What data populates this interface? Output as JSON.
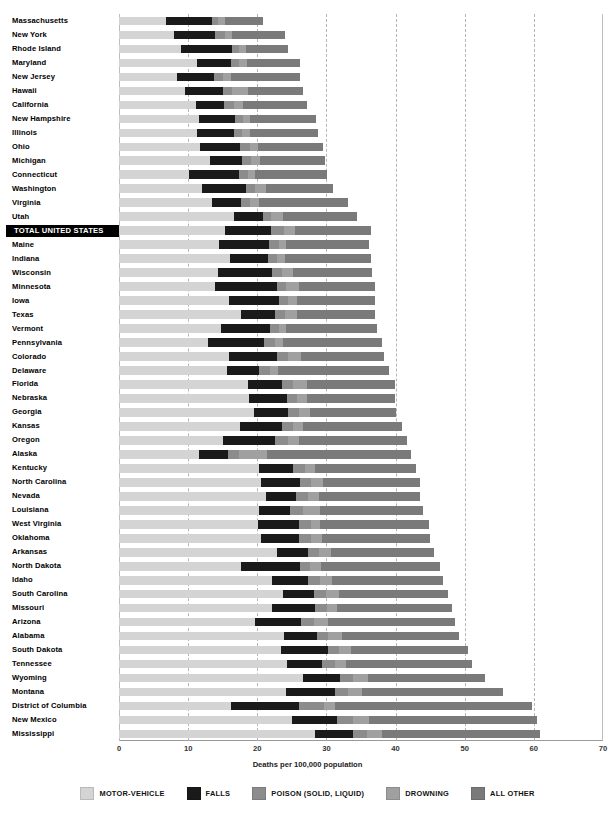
{
  "chart_data": {
    "type": "bar",
    "orientation": "horizontal",
    "stacked": true,
    "title": "",
    "xlabel": "Deaths per 100,000 population",
    "ylabel": "",
    "xlim": [
      0,
      70
    ],
    "xticks": [
      0,
      10,
      20,
      30,
      40,
      50,
      60,
      70
    ],
    "grid": "vertical dashed at 10,20,30,40,50,60",
    "legend_position": "bottom",
    "series": [
      {
        "name": "MOTOR-VEHICLE",
        "color": "#d4d4d4"
      },
      {
        "name": "FALLS",
        "color": "#1a1a1a"
      },
      {
        "name": "POISON (SOLID, LIQUID)",
        "color": "#8c8c8c"
      },
      {
        "name": "DROWNING",
        "color": "#a0a0a0"
      },
      {
        "name": "ALL OTHER",
        "color": "#7a7a7a"
      }
    ],
    "categories": [
      "Massachusetts",
      "New York",
      "Rhode Island",
      "Maryland",
      "New Jersey",
      "Hawaii",
      "California",
      "New Hampshire",
      "Illinois",
      "Ohio",
      "Michigan",
      "Connecticut",
      "Washington",
      "Virginia",
      "Utah",
      "TOTAL UNITED STATES",
      "Maine",
      "Indiana",
      "Wisconsin",
      "Minnesota",
      "Iowa",
      "Texas",
      "Vermont",
      "Pennsylvania",
      "Colorado",
      "Delaware",
      "Florida",
      "Nebraska",
      "Georgia",
      "Kansas",
      "Oregon",
      "Alaska",
      "Kentucky",
      "North Carolina",
      "Nevada",
      "Louisiana",
      "West Virginia",
      "Oklahoma",
      "Arkansas",
      "North Dakota",
      "Idaho",
      "South Carolina",
      "Missouri",
      "Arizona",
      "Alabama",
      "South Dakota",
      "Tennessee",
      "Wyoming",
      "Montana",
      "District of Columbia",
      "New Mexico",
      "Mississippi"
    ],
    "rows": [
      {
        "state": "Massachusetts",
        "total": 20.9,
        "values": [
          6.8,
          6.6,
          0.9,
          1.0,
          5.6
        ],
        "highlight": false
      },
      {
        "state": "New York",
        "total": 24.0,
        "values": [
          7.9,
          6.0,
          1.4,
          1.1,
          7.6
        ],
        "highlight": false
      },
      {
        "state": "Rhode Island",
        "total": 24.5,
        "values": [
          9.0,
          7.3,
          1.0,
          1.0,
          6.2
        ],
        "highlight": false
      },
      {
        "state": "Maryland",
        "total": 26.2,
        "values": [
          11.3,
          4.9,
          1.1,
          1.2,
          7.7
        ],
        "highlight": false
      },
      {
        "state": "New Jersey",
        "total": 26.2,
        "values": [
          8.4,
          5.3,
          1.3,
          1.2,
          10.0
        ],
        "highlight": false
      },
      {
        "state": "Hawaii",
        "total": 26.6,
        "values": [
          9.6,
          5.4,
          1.3,
          2.4,
          7.9
        ],
        "highlight": false
      },
      {
        "state": "California",
        "total": 27.2,
        "values": [
          11.1,
          4.1,
          1.4,
          1.4,
          9.2
        ],
        "highlight": false
      },
      {
        "state": "New Hampshire",
        "total": 28.5,
        "values": [
          11.6,
          5.2,
          1.2,
          1.0,
          9.5
        ],
        "highlight": false
      },
      {
        "state": "Illinois",
        "total": 28.8,
        "values": [
          11.3,
          5.3,
          1.2,
          1.2,
          9.8
        ],
        "highlight": false
      },
      {
        "state": "Ohio",
        "total": 29.5,
        "values": [
          11.7,
          5.8,
          1.5,
          1.1,
          9.4
        ],
        "highlight": false
      },
      {
        "state": "Michigan",
        "total": 29.8,
        "values": [
          13.1,
          4.7,
          1.3,
          1.3,
          9.4
        ],
        "highlight": false
      },
      {
        "state": "Connecticut",
        "total": 30.1,
        "values": [
          10.1,
          7.2,
          1.3,
          1.0,
          10.5
        ],
        "highlight": false
      },
      {
        "state": "Washington",
        "total": 31.0,
        "values": [
          12.0,
          6.4,
          1.3,
          1.5,
          9.8
        ],
        "highlight": false
      },
      {
        "state": "Virginia",
        "total": 33.1,
        "values": [
          13.5,
          4.1,
          1.4,
          1.3,
          12.8
        ],
        "highlight": false
      },
      {
        "state": "Utah",
        "total": 34.4,
        "values": [
          16.6,
          4.3,
          1.1,
          1.7,
          10.7
        ],
        "highlight": false
      },
      {
        "state": "TOTAL UNITED STATES",
        "total": 36.5,
        "values": [
          15.4,
          6.6,
          1.9,
          1.5,
          11.1
        ],
        "highlight": true
      },
      {
        "state": "Maine",
        "total": 36.2,
        "values": [
          14.5,
          7.2,
          1.4,
          1.1,
          12.0
        ],
        "highlight": false
      },
      {
        "state": "Indiana",
        "total": 36.5,
        "values": [
          16.1,
          5.4,
          1.4,
          1.1,
          12.5
        ],
        "highlight": false
      },
      {
        "state": "Wisconsin",
        "total": 36.6,
        "values": [
          14.3,
          7.9,
          1.4,
          1.5,
          11.5
        ],
        "highlight": false
      },
      {
        "state": "Minnesota",
        "total": 37.0,
        "values": [
          13.9,
          9.0,
          1.3,
          1.8,
          11.0
        ],
        "highlight": false
      },
      {
        "state": "Iowa",
        "total": 37.0,
        "values": [
          15.9,
          7.3,
          1.2,
          1.4,
          11.2
        ],
        "highlight": false
      },
      {
        "state": "Texas",
        "total": 37.1,
        "values": [
          17.7,
          4.8,
          1.5,
          1.8,
          11.3
        ],
        "highlight": false
      },
      {
        "state": "Vermont",
        "total": 37.3,
        "values": [
          14.8,
          7.0,
          1.3,
          1.1,
          13.1
        ],
        "highlight": false
      },
      {
        "state": "Pennsylvania",
        "total": 38.1,
        "values": [
          12.8,
          8.2,
          1.6,
          1.1,
          14.4
        ],
        "highlight": false
      },
      {
        "state": "Colorado",
        "total": 38.4,
        "values": [
          15.9,
          6.9,
          1.6,
          1.9,
          12.1
        ],
        "highlight": false
      },
      {
        "state": "Delaware",
        "total": 39.0,
        "values": [
          15.6,
          4.7,
          1.5,
          1.2,
          16.0
        ],
        "highlight": false
      },
      {
        "state": "Florida",
        "total": 39.9,
        "values": [
          18.6,
          5.0,
          1.6,
          2.0,
          12.7
        ],
        "highlight": false
      },
      {
        "state": "Nebraska",
        "total": 39.9,
        "values": [
          18.8,
          5.5,
          1.5,
          1.4,
          12.7
        ],
        "highlight": false
      },
      {
        "state": "Georgia",
        "total": 40.0,
        "values": [
          19.5,
          5.0,
          1.5,
          1.6,
          12.4
        ],
        "highlight": false
      },
      {
        "state": "Kansas",
        "total": 41.0,
        "values": [
          17.5,
          6.1,
          1.5,
          1.5,
          14.4
        ],
        "highlight": false
      },
      {
        "state": "Oregon",
        "total": 41.6,
        "values": [
          15.0,
          7.6,
          1.8,
          1.6,
          15.6
        ],
        "highlight": false
      },
      {
        "state": "Alaska",
        "total": 42.3,
        "values": [
          11.6,
          4.1,
          1.7,
          4.0,
          20.9
        ],
        "highlight": false
      },
      {
        "state": "Kentucky",
        "total": 43.0,
        "values": [
          20.2,
          5.0,
          1.7,
          1.5,
          14.6
        ],
        "highlight": false
      },
      {
        "state": "North Carolina",
        "total": 43.5,
        "values": [
          20.6,
          5.6,
          1.6,
          1.7,
          14.0
        ],
        "highlight": false
      },
      {
        "state": "Nevada",
        "total": 43.6,
        "values": [
          21.3,
          4.3,
          1.7,
          1.6,
          14.7
        ],
        "highlight": false
      },
      {
        "state": "Louisiana",
        "total": 44.0,
        "values": [
          20.3,
          4.5,
          1.8,
          2.5,
          14.9
        ],
        "highlight": false
      },
      {
        "state": "West Virginia",
        "total": 44.8,
        "values": [
          20.1,
          6.0,
          1.7,
          1.3,
          15.7
        ],
        "highlight": false
      },
      {
        "state": "Oklahoma",
        "total": 45.0,
        "values": [
          20.6,
          5.5,
          1.6,
          1.6,
          15.7
        ],
        "highlight": false
      },
      {
        "state": "Arkansas",
        "total": 45.5,
        "values": [
          22.8,
          4.5,
          1.6,
          1.7,
          14.9
        ],
        "highlight": false
      },
      {
        "state": "North Dakota",
        "total": 46.5,
        "values": [
          17.7,
          8.5,
          1.4,
          1.6,
          17.3
        ],
        "highlight": false
      },
      {
        "state": "Idaho",
        "total": 46.9,
        "values": [
          22.2,
          5.2,
          1.6,
          1.8,
          16.1
        ],
        "highlight": false
      },
      {
        "state": "South Carolina",
        "total": 47.6,
        "values": [
          23.7,
          4.5,
          1.7,
          1.9,
          15.8
        ],
        "highlight": false
      },
      {
        "state": "Missouri",
        "total": 48.2,
        "values": [
          22.1,
          6.2,
          1.8,
          1.5,
          16.6
        ],
        "highlight": false
      },
      {
        "state": "Arizona",
        "total": 48.6,
        "values": [
          19.7,
          6.6,
          1.9,
          2.1,
          18.3
        ],
        "highlight": false
      },
      {
        "state": "Alabama",
        "total": 49.2,
        "values": [
          23.9,
          4.7,
          1.7,
          2.0,
          16.9
        ],
        "highlight": false
      },
      {
        "state": "South Dakota",
        "total": 50.5,
        "values": [
          23.4,
          6.8,
          1.6,
          1.7,
          17.0
        ],
        "highlight": false
      },
      {
        "state": "Tennessee",
        "total": 51.0,
        "values": [
          24.3,
          5.1,
          1.8,
          1.6,
          18.2
        ],
        "highlight": false
      },
      {
        "state": "Wyoming",
        "total": 53.0,
        "values": [
          26.6,
          5.4,
          1.8,
          2.2,
          17.0
        ],
        "highlight": false
      },
      {
        "state": "Montana",
        "total": 55.6,
        "values": [
          24.2,
          7.0,
          1.9,
          2.0,
          20.5
        ],
        "highlight": false
      },
      {
        "state": "District of Columbia",
        "total": 59.8,
        "values": [
          16.2,
          9.8,
          3.6,
          1.6,
          28.6
        ],
        "highlight": false
      },
      {
        "state": "New Mexico",
        "total": 60.5,
        "values": [
          25.0,
          6.6,
          2.2,
          2.3,
          24.4
        ],
        "highlight": false
      },
      {
        "state": "Mississippi",
        "total": 60.9,
        "values": [
          28.3,
          5.6,
          1.9,
          2.3,
          22.8
        ],
        "highlight": false
      }
    ]
  },
  "axis": {
    "tick_labels": [
      "0",
      "10",
      "20",
      "30",
      "40",
      "50",
      "60",
      "70"
    ],
    "x_title": "Deaths per 100,000 population"
  },
  "legend": {
    "items": [
      {
        "label": "MOTOR-VEHICLE",
        "color": "#d4d4d4"
      },
      {
        "label": "FALLS",
        "color": "#1a1a1a"
      },
      {
        "label": "POISON (SOLID, LIQUID)",
        "color": "#8c8c8c"
      },
      {
        "label": "DROWNING",
        "color": "#a0a0a0"
      },
      {
        "label": "ALL OTHER",
        "color": "#7a7a7a"
      }
    ]
  }
}
